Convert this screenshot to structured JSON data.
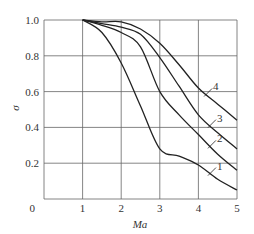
{
  "chart_data": {
    "type": "line",
    "title": "",
    "xlabel": "Ma",
    "ylabel": "σ",
    "xlim": [
      0,
      5
    ],
    "ylim": [
      0,
      1.0
    ],
    "grid": true,
    "legend_position": "inline curve labels",
    "x_ticks": [
      "0",
      "1",
      "2",
      "3",
      "4",
      "5"
    ],
    "y_ticks": [
      "0",
      "0.2",
      "0.4",
      "0.6",
      "0.8",
      "1.0"
    ],
    "x": [
      1.0,
      1.5,
      2.0,
      2.5,
      3.0,
      3.5,
      4.0,
      4.5,
      5.0
    ],
    "series": [
      {
        "name": "1",
        "values": [
          1.0,
          0.93,
          0.76,
          0.52,
          0.28,
          0.24,
          0.19,
          0.11,
          0.05
        ]
      },
      {
        "name": "2",
        "values": [
          1.0,
          0.97,
          0.93,
          0.85,
          0.6,
          0.47,
          0.36,
          0.25,
          0.16
        ]
      },
      {
        "name": "3",
        "values": [
          1.0,
          0.98,
          0.96,
          0.92,
          0.79,
          0.63,
          0.47,
          0.37,
          0.28
        ]
      },
      {
        "name": "4",
        "values": [
          1.0,
          0.99,
          0.99,
          0.95,
          0.87,
          0.75,
          0.62,
          0.53,
          0.44
        ]
      }
    ],
    "annotations": [
      "1",
      "2",
      "3",
      "4"
    ]
  },
  "colors": {
    "line": "#222222",
    "grid": "#666666",
    "text": "#333333"
  }
}
